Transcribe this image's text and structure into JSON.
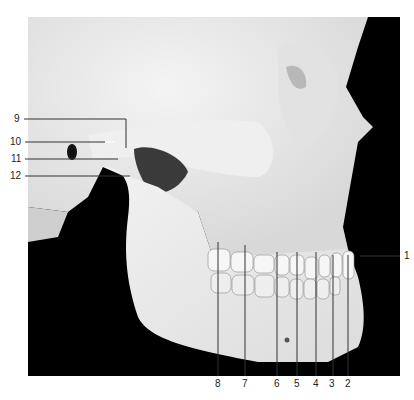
{
  "figure": {
    "left_labels": [
      {
        "num": "9",
        "x": 14,
        "y": 118
      },
      {
        "num": "10",
        "x": 10,
        "y": 142
      },
      {
        "num": "11",
        "x": 11,
        "y": 158
      },
      {
        "num": "12",
        "x": 10,
        "y": 176
      }
    ],
    "right_labels": [
      {
        "num": "1",
        "x": 403,
        "y": 251
      }
    ],
    "bottom_labels": [
      {
        "num": "8",
        "x": 215,
        "y": 378
      },
      {
        "num": "7",
        "x": 242,
        "y": 378
      },
      {
        "num": "6",
        "x": 274,
        "y": 378
      },
      {
        "num": "5",
        "x": 294,
        "y": 378
      },
      {
        "num": "4",
        "x": 313,
        "y": 378
      },
      {
        "num": "3",
        "x": 329,
        "y": 378
      },
      {
        "num": "2",
        "x": 345,
        "y": 378
      }
    ],
    "colors": {
      "bone": "#ededed",
      "background": "#000000",
      "leader": "#333333"
    }
  }
}
